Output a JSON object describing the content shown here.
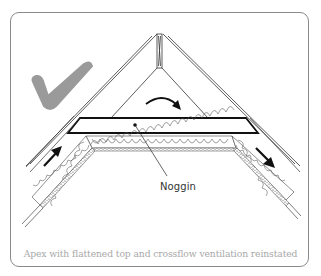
{
  "figure": {
    "type": "roof-apex-cross-section",
    "status_mark": "check",
    "status_mark_color": "#9a9a9a",
    "line_color": "#222222",
    "frame_color": "#8a8a8a",
    "caption_color": "#a8a8a8"
  },
  "labels": {
    "noggin": "Noggin"
  },
  "caption": "Apex with flattened top and crossflow ventilation reinstated",
  "annotations": {
    "airflow_arrows": [
      "up-left-slope",
      "over-noggin-curved",
      "down-right-slope"
    ]
  }
}
